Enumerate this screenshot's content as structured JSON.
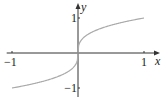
{
  "chart_data": {
    "type": "line",
    "title": "",
    "function": "y = x^(1/3)",
    "xlabel": "x",
    "ylabel": "y",
    "xlim": [
      -1.05,
      1.2
    ],
    "ylim": [
      -1.1,
      1.4
    ],
    "x_ticks": [
      {
        "value": -1,
        "label": "−1"
      },
      {
        "value": 1,
        "label": "1"
      }
    ],
    "y_ticks": [
      {
        "value": 1,
        "label": "1"
      },
      {
        "value": -1,
        "label": "−1"
      }
    ],
    "grid": false,
    "series": [
      {
        "name": "cube-root",
        "color": "#aaaaaa",
        "x": [
          -1,
          -0.9,
          -0.8,
          -0.7,
          -0.6,
          -0.5,
          -0.4,
          -0.3,
          -0.2,
          -0.1,
          -0.05,
          -0.01,
          0,
          0.01,
          0.05,
          0.1,
          0.2,
          0.3,
          0.4,
          0.5,
          0.6,
          0.7,
          0.8,
          0.9,
          1
        ],
        "y": [
          -1,
          -0.965,
          -0.928,
          -0.888,
          -0.843,
          -0.794,
          -0.737,
          -0.669,
          -0.585,
          -0.464,
          -0.368,
          -0.215,
          0,
          0.215,
          0.368,
          0.464,
          0.585,
          0.669,
          0.737,
          0.794,
          0.843,
          0.888,
          0.928,
          0.965,
          1
        ]
      }
    ],
    "axis_color": "#333333"
  }
}
